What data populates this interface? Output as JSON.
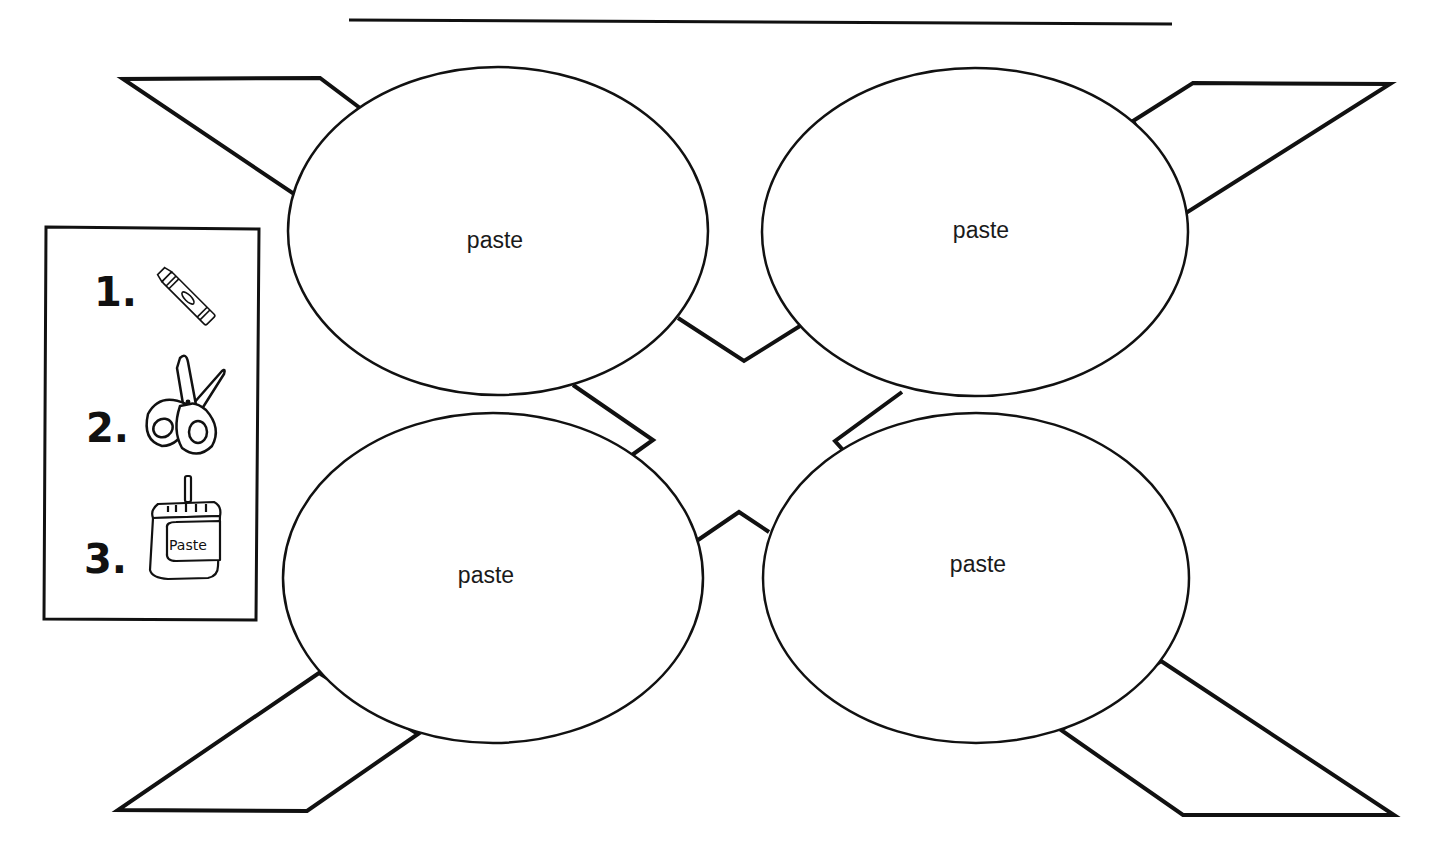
{
  "worksheet": {
    "name_line": {
      "x1": 349,
      "y1": 20,
      "x2": 1172,
      "y2": 24
    },
    "colors": {
      "ink": "#111111",
      "paper": "#ffffff"
    },
    "ellipses": [
      {
        "label": "paste",
        "cx": 498,
        "cy": 231,
        "rx": 210,
        "ry": 164,
        "label_x": 495,
        "label_y": 248
      },
      {
        "label": "paste",
        "cx": 975,
        "cy": 232,
        "rx": 213,
        "ry": 164,
        "label_x": 981,
        "label_y": 238
      },
      {
        "label": "paste",
        "cx": 493,
        "cy": 578,
        "rx": 210,
        "ry": 165,
        "label_x": 486,
        "label_y": 583
      },
      {
        "label": "paste",
        "cx": 976,
        "cy": 578,
        "rx": 213,
        "ry": 165,
        "label_x": 978,
        "label_y": 572
      }
    ],
    "instructions": {
      "steps": [
        {
          "number": "1.",
          "icon": "crayon-icon"
        },
        {
          "number": "2.",
          "icon": "scissors-icon"
        },
        {
          "number": "3.",
          "icon": "paste-jar-icon",
          "jar_text": "Paste"
        }
      ]
    }
  }
}
